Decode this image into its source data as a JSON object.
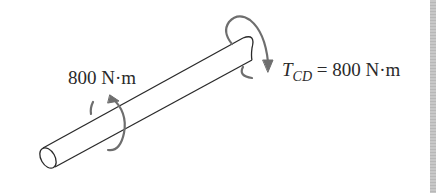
{
  "diagram": {
    "type": "shaft-torque-free-body",
    "left_torque": {
      "value": "800",
      "unit": "N·m",
      "text": "800 N·m"
    },
    "right_torque": {
      "symbol": "T",
      "subscript": "CD",
      "equals": "=",
      "value": "800",
      "unit": "N·m",
      "value_text": "800 N·m"
    },
    "colors": {
      "line": "#2a2a2a",
      "arrow": "#6e6e6e",
      "edge_bar": "#c0c0c0",
      "background": "#ffffff"
    }
  }
}
